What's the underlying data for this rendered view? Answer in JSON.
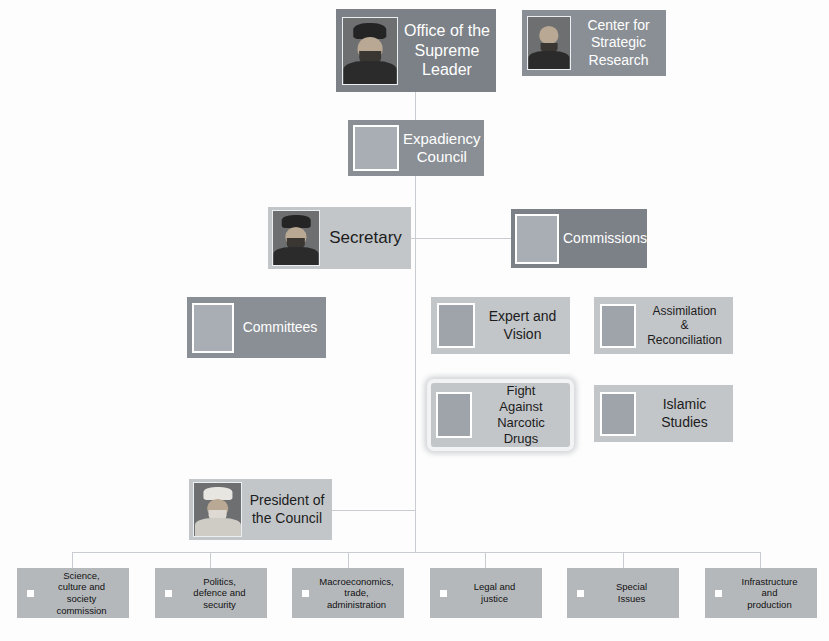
{
  "diagram": {
    "colors": {
      "background": "#fdfdfd",
      "connector": "#c9cdd2",
      "dark_node": "#7c8187",
      "mid_node": "#8a8f95",
      "light_node": "#c3c6c9",
      "commission_node": "#b5b8bb",
      "selection_highlight": "#f2f3f4"
    },
    "nodes": {
      "supreme_leader": {
        "label": "Office of the\nSupreme\nLeader",
        "icon": "portrait-thumbnail"
      },
      "strategic_research": {
        "label": "Center for\nStrategic\nResearch",
        "icon": "portrait-thumbnail"
      },
      "expediency_council": {
        "label": "Expadiency\nCouncil",
        "icon": "placeholder-thumbnail"
      },
      "secretary": {
        "label": "Secretary",
        "icon": "portrait-thumbnail"
      },
      "commissions": {
        "label": "Commissions",
        "icon": "placeholder-thumbnail"
      },
      "committees": {
        "label": "Committees",
        "icon": "placeholder-thumbnail"
      },
      "expert_and_vision": {
        "label": "Expert and\nVision",
        "icon": "placeholder-thumbnail"
      },
      "assimilation": {
        "label": "Assimilation\n&\nReconciliation",
        "icon": "placeholder-thumbnail"
      },
      "narcotic_drugs": {
        "label": "Fight\nAgainst\nNarcotic\nDrugs",
        "icon": "placeholder-thumbnail",
        "selected": true
      },
      "islamic_studies": {
        "label": "Islamic\nStudies",
        "icon": "placeholder-thumbnail"
      },
      "president": {
        "label": "President of\nthe Council",
        "icon": "portrait-thumbnail"
      }
    },
    "commissions_row": [
      {
        "label": "Science,\nculture and\nsociety\ncommission",
        "icon": "square-bullet-icon"
      },
      {
        "label": "Politics,\ndefence and\nsecurity",
        "icon": "square-bullet-icon"
      },
      {
        "label": "Macroeconomics,\ntrade,\nadministration",
        "icon": "square-bullet-icon"
      },
      {
        "label": "Legal and\njustice",
        "icon": "square-bullet-icon"
      },
      {
        "label": "Special\nIssues",
        "icon": "square-bullet-icon"
      },
      {
        "label": "Infrastructure\nand\nproduction",
        "icon": "square-bullet-icon"
      }
    ]
  }
}
